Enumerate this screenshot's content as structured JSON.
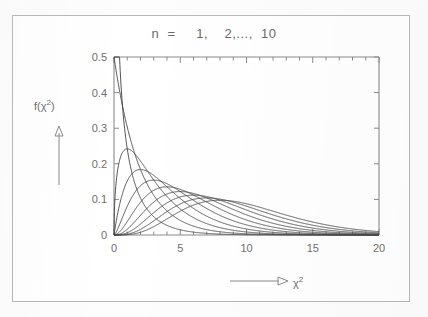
{
  "figure": {
    "title": "n  =     1,    2,...,  10",
    "y_axis_label": "f(χ²)",
    "x_axis_label": "χ²",
    "line_color": "#4a4a4a",
    "axis_color": "#8a8a8a",
    "frame_color": "#b9b9b9"
  },
  "chart_data": {
    "type": "line",
    "title": "n  =     1,    2,...,  10",
    "xlabel": "χ²",
    "ylabel": "f(χ²)",
    "xlim": [
      0,
      20
    ],
    "ylim": [
      0,
      0.5
    ],
    "xticks": [
      0,
      5,
      10,
      15,
      20
    ],
    "xtick_labels": [
      "0",
      "5",
      "10",
      "15",
      "20"
    ],
    "yticks": [
      0,
      0.1,
      0.2,
      0.3,
      0.4,
      0.5
    ],
    "ytick_labels": [
      "0",
      "0.1",
      "0.2",
      "0.3",
      "0.4",
      "0.5"
    ],
    "minor_xtick_step": 1,
    "minor_ytick_step": 0.1,
    "grid": false,
    "legend": "none",
    "annotation": "Chi-square probability density functions for degrees of freedom n = 1, 2, ..., 10",
    "series": [
      {
        "name": "n = 1",
        "df": 1,
        "peak_x": 0.0,
        "peak_y": 0.5,
        "note": "monotone decreasing, clipped at y = 0.5"
      },
      {
        "name": "n = 2",
        "df": 2,
        "peak_x": 0.0,
        "peak_y": 0.5,
        "note": "exponential decay, f(0) = 0.5"
      },
      {
        "name": "n = 3",
        "df": 3,
        "peak_x": 1.0,
        "peak_y": 0.242
      },
      {
        "name": "n = 4",
        "df": 4,
        "peak_x": 2.0,
        "peak_y": 0.184
      },
      {
        "name": "n = 5",
        "df": 5,
        "peak_x": 3.0,
        "peak_y": 0.154
      },
      {
        "name": "n = 6",
        "df": 6,
        "peak_x": 4.0,
        "peak_y": 0.135
      },
      {
        "name": "n = 7",
        "df": 7,
        "peak_x": 5.0,
        "peak_y": 0.122
      },
      {
        "name": "n = 8",
        "df": 8,
        "peak_x": 6.0,
        "peak_y": 0.112
      },
      {
        "name": "n = 9",
        "df": 9,
        "peak_x": 7.0,
        "peak_y": 0.104
      },
      {
        "name": "n = 10",
        "df": 10,
        "peak_x": 8.0,
        "peak_y": 0.098
      }
    ]
  }
}
